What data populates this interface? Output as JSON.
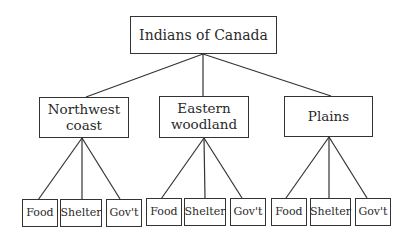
{
  "root": {
    "label": "Indians of Canada"
  },
  "regions": [
    {
      "label_line1": "Northwest",
      "label_line2": "coast",
      "children": [
        {
          "label": "Food"
        },
        {
          "label": "Shelter"
        },
        {
          "label": "Gov't"
        }
      ]
    },
    {
      "label_line1": "Eastern",
      "label_line2": "woodland",
      "children": [
        {
          "label": "Food"
        },
        {
          "label": "Shelter"
        },
        {
          "label": "Gov't"
        }
      ]
    },
    {
      "label_line1": "Plains",
      "label_line2": "",
      "children": [
        {
          "label": "Food"
        },
        {
          "label": "Shelter"
        },
        {
          "label": "Gov't"
        }
      ]
    }
  ],
  "colors": {
    "line": "#333333",
    "background": "#ffffff",
    "text": "#2a2a2a"
  }
}
